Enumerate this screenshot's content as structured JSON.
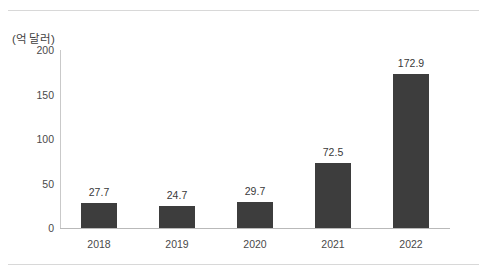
{
  "chart_data": {
    "type": "bar",
    "title": "",
    "subtitle": "",
    "xlabel": "",
    "ylabel": "",
    "unit_label": "(억 달러)",
    "categories": [
      "2018",
      "2019",
      "2020",
      "2021",
      "2022"
    ],
    "values": [
      27.7,
      24.7,
      29.7,
      72.5,
      172.9
    ],
    "value_labels": [
      "27.7",
      "24.7",
      "29.7",
      "72.5",
      "172.9"
    ],
    "ylim": [
      0,
      200
    ],
    "yticks": [
      0,
      50,
      100,
      150,
      200
    ],
    "ytick_labels": [
      "0",
      "50",
      "100",
      "150",
      "200"
    ],
    "grid": false,
    "legend": null,
    "legend_position": "none",
    "bar_color": "#3d3d3d",
    "axis_color": "#bfbfbf",
    "text_color": "#3f3f3f",
    "background_color": "#ffffff",
    "rule_color": "#d8d8d8"
  }
}
